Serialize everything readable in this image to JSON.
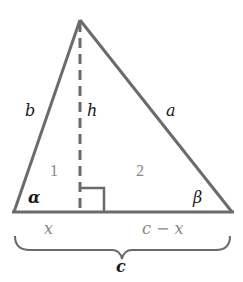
{
  "diagram": {
    "type": "triangle-with-altitude",
    "vertices": {
      "apex": [
        80,
        20
      ],
      "bottom_left": [
        14,
        212
      ],
      "bottom_right": [
        232,
        212
      ],
      "altitude_foot": [
        80,
        212
      ]
    },
    "colors": {
      "stroke": "#6b6b6b",
      "text": "#1a1a1a",
      "muted_text": "#888888"
    },
    "labels": {
      "side_left": "b",
      "altitude": "h",
      "side_right": "a",
      "region_left": "1",
      "region_right": "2",
      "angle_left": "α",
      "angle_right": "β",
      "segment_left": "x",
      "segment_right": "c − x",
      "base": "c"
    }
  }
}
